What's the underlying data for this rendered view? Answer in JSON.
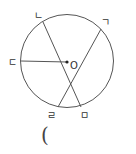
{
  "diagram": {
    "type": "circle-geometry",
    "center_label": "O",
    "labels": {
      "g": "ㄱ",
      "n": "ㄴ",
      "d": "ㄷ",
      "r": "ㄹ",
      "m": "ㅁ"
    },
    "segments": [
      {
        "name": "ㄴ-ㅁ",
        "type": "chord"
      },
      {
        "name": "ㄱ-ㄹ",
        "type": "chord"
      },
      {
        "name": "ㄷ-O",
        "type": "radius"
      }
    ],
    "answer_paren": "("
  }
}
